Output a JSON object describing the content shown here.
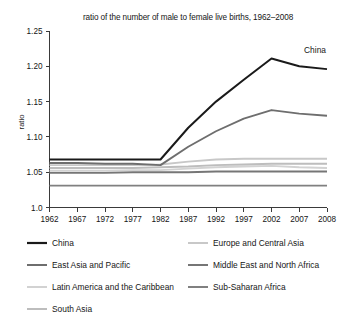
{
  "chart_data": {
    "type": "line",
    "title": "ratio of the number of male to female live births, 1962–2008",
    "xlabel": "",
    "ylabel": "ratio",
    "x": [
      1962,
      1967,
      1972,
      1977,
      1982,
      1987,
      1992,
      1997,
      2002,
      2007,
      2008
    ],
    "xtick_labels": [
      "1962",
      "1967",
      "1972",
      "1977",
      "1982",
      "1987",
      "1992",
      "1997",
      "2002",
      "2007",
      "2008"
    ],
    "ytick_labels": [
      "1.0",
      "1.05",
      "1.10",
      "1.15",
      "1.20",
      "1.25"
    ],
    "ytick_values": [
      1.0,
      1.05,
      1.1,
      1.15,
      1.2,
      1.25
    ],
    "xlim": [
      1962,
      2008
    ],
    "ylim": [
      1.0,
      1.25
    ],
    "grid": false,
    "legend_position": "below",
    "annotations": [
      {
        "text": "China",
        "x": 2004.2,
        "y": 1.213,
        "series": "China"
      }
    ],
    "series": [
      {
        "name": "China",
        "color": "#1a1a1a",
        "width": 2.0,
        "values": [
          1.068,
          1.068,
          1.068,
          1.068,
          1.068,
          1.113,
          1.15,
          1.181,
          1.211,
          1.2,
          1.196
        ]
      },
      {
        "name": "East Asia and Pacific",
        "color": "#6e6e6e",
        "width": 1.9,
        "values": [
          1.063,
          1.063,
          1.062,
          1.062,
          1.06,
          1.086,
          1.108,
          1.126,
          1.138,
          1.133,
          1.13
        ]
      },
      {
        "name": "Latin America and the Caribbean",
        "color": "#d2d2d2",
        "width": 1.9,
        "values": [
          1.052,
          1.052,
          1.052,
          1.053,
          1.053,
          1.055,
          1.057,
          1.058,
          1.059,
          1.057,
          1.056
        ]
      },
      {
        "name": "South Asia",
        "color": "#bdbdbd",
        "width": 1.9,
        "values": [
          1.056,
          1.056,
          1.056,
          1.056,
          1.057,
          1.058,
          1.06,
          1.061,
          1.062,
          1.062,
          1.062
        ]
      },
      {
        "name": "Europe and Central Asia",
        "color": "#c8c8c8",
        "width": 1.9,
        "values": [
          1.06,
          1.06,
          1.06,
          1.06,
          1.061,
          1.065,
          1.068,
          1.069,
          1.069,
          1.069,
          1.069
        ]
      },
      {
        "name": "Middle East and North Africa",
        "color": "#767676",
        "width": 1.9,
        "values": [
          1.049,
          1.049,
          1.049,
          1.05,
          1.05,
          1.05,
          1.051,
          1.051,
          1.051,
          1.051,
          1.051
        ]
      },
      {
        "name": "Sub-Saharan Africa",
        "color": "#808080",
        "width": 1.9,
        "values": [
          1.031,
          1.031,
          1.031,
          1.031,
          1.031,
          1.031,
          1.031,
          1.031,
          1.031,
          1.031,
          1.031
        ]
      }
    ],
    "legend": [
      {
        "label": "China",
        "color": "#1a1a1a",
        "column": "left"
      },
      {
        "label": "East Asia and Pacific",
        "color": "#6e6e6e",
        "column": "left"
      },
      {
        "label": "Latin America and the Caribbean",
        "color": "#d2d2d2",
        "column": "left"
      },
      {
        "label": "South Asia",
        "color": "#bdbdbd",
        "column": "left"
      },
      {
        "label": "Europe and Central Asia",
        "color": "#c8c8c8",
        "column": "right"
      },
      {
        "label": "Middle East and North Africa",
        "color": "#767676",
        "column": "right"
      },
      {
        "label": "Sub-Saharan Africa",
        "color": "#808080",
        "column": "right"
      }
    ]
  }
}
